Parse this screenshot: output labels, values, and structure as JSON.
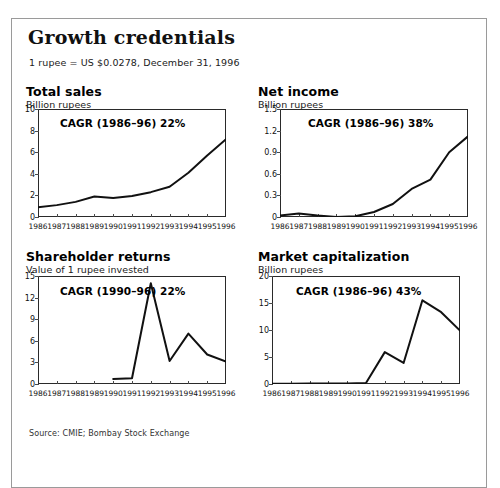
{
  "panel": {
    "title": "Growth credentials",
    "fx_note": "1 rupee = US $0.0278, December 31, 1996",
    "source": "Source: CMIE; Bombay Stock Exchange"
  },
  "chart_data": [
    {
      "id": "total-sales",
      "type": "line",
      "title": "Total sales",
      "subtitle": "Billion rupees",
      "annotation": "CAGR (1986–96) 22%",
      "xlabel": "",
      "ylabel": "Billion rupees",
      "categories": [
        "1986",
        "1987",
        "1988",
        "1989",
        "1990",
        "1991",
        "1992",
        "1993",
        "1994",
        "1995",
        "1996"
      ],
      "values": [
        0.9,
        1.1,
        1.4,
        1.9,
        1.75,
        1.95,
        2.3,
        2.8,
        4.1,
        5.7,
        7.2
      ],
      "ylim": [
        0,
        10
      ],
      "yticks": [
        "0",
        "2",
        "4",
        "6",
        "8",
        "10"
      ],
      "ytickvals": [
        0,
        2,
        4,
        6,
        8,
        10
      ],
      "grid": false
    },
    {
      "id": "net-income",
      "type": "line",
      "title": "Net income",
      "subtitle": "Billion rupees",
      "annotation": "CAGR (1986–96) 38%",
      "xlabel": "",
      "ylabel": "Billion rupees",
      "categories": [
        "1986",
        "1987",
        "1988",
        "1989",
        "1990",
        "1991",
        "1992",
        "1993",
        "1994",
        "1995",
        "1996"
      ],
      "values": [
        0.02,
        0.05,
        0.02,
        0.0,
        0.01,
        0.07,
        0.18,
        0.39,
        0.52,
        0.9,
        1.12
      ],
      "ylim": [
        0,
        1.5
      ],
      "yticks": [
        "0",
        "0.3",
        "0.6",
        "0.9",
        "1.2",
        "1.5"
      ],
      "ytickvals": [
        0,
        0.3,
        0.6,
        0.9,
        1.2,
        1.5
      ],
      "grid": false
    },
    {
      "id": "shareholder-returns",
      "type": "line",
      "title": "Shareholder returns",
      "subtitle": "Value of 1 rupee invested",
      "annotation": "CAGR (1990–96) 22%",
      "xlabel": "",
      "ylabel": "Value of 1 rupee invested",
      "categories": [
        "1986",
        "1987",
        "1988",
        "1989",
        "1990",
        "1991",
        "1992",
        "1993",
        "1994",
        "1995",
        "1996"
      ],
      "values": [
        null,
        null,
        null,
        null,
        0.7,
        0.8,
        14.0,
        3.2,
        7.0,
        4.1,
        3.1
      ],
      "ylim": [
        0,
        15
      ],
      "yticks": [
        "0",
        "3",
        "6",
        "9",
        "12",
        "15"
      ],
      "ytickvals": [
        0,
        3,
        6,
        9,
        12,
        15
      ],
      "grid": false
    },
    {
      "id": "market-capitalization",
      "type": "line",
      "title": "Market capitalization",
      "subtitle": "Billion rupees",
      "annotation": "CAGR (1986–96) 43%",
      "xlabel": "",
      "ylabel": "Billion rupees",
      "categories": [
        "1986",
        "1987",
        "1988",
        "1989",
        "1990",
        "1991",
        "1992",
        "1993",
        "1994",
        "1995",
        "1996"
      ],
      "values": [
        0.05,
        0.06,
        0.07,
        0.08,
        0.09,
        0.2,
        5.9,
        3.9,
        15.5,
        13.3,
        9.9
      ],
      "ylim": [
        0,
        20
      ],
      "yticks": [
        "0",
        "5",
        "10",
        "15",
        "20"
      ],
      "ytickvals": [
        0,
        5,
        10,
        15,
        20
      ],
      "grid": false
    }
  ]
}
